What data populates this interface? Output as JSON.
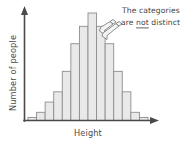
{
  "figure": {
    "name": "histogram-continuous-categories",
    "background_color": "#ffffff",
    "ink_color": "#4a4a4a"
  },
  "axes": {
    "y_label": "Number of people",
    "x_label": "Height",
    "y_arrow": "up-arrow",
    "x_arrow": "right-arrow",
    "show_ticks": false,
    "show_grid": false
  },
  "annotation": {
    "line1": "The categories",
    "line2_before": "are ",
    "line2_emphasis": "not",
    "line2_after": " distinct",
    "emphasis_style": "underline",
    "pointer_count": 2,
    "pointer_target": "boundary-between-adjacent-bars"
  },
  "style": {
    "bar_fill": "#e9e9e9",
    "bar_stroke": "#8e8e8e",
    "text_color": "#3f3f3f"
  },
  "chart_data": {
    "type": "bar",
    "title": "",
    "subtitle": "",
    "xlabel": "Height",
    "ylabel": "Number of people",
    "categories": [
      "1",
      "2",
      "3",
      "4",
      "5",
      "6",
      "7",
      "8",
      "9",
      "10",
      "11",
      "12",
      "13",
      "14"
    ],
    "values": [
      3,
      8,
      18,
      28,
      48,
      75,
      92,
      105,
      92,
      75,
      48,
      28,
      8,
      3
    ],
    "xlim": [
      0,
      14
    ],
    "ylim": [
      0,
      112
    ],
    "grid": false,
    "legend": null,
    "tick_labels_x": [],
    "tick_labels_y": [],
    "annotations": [
      {
        "text": "The categories are not distinct",
        "points_to_category_boundary": "8-9"
      }
    ],
    "distribution_shape": "bell-shaped / normal",
    "bars_touch": true
  }
}
